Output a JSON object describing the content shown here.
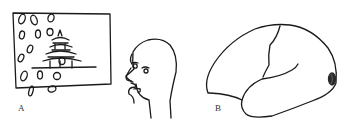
{
  "figure": {
    "panels": [
      {
        "label": "A",
        "description": "Sketch of a person in profile viewing a framed picture of a pagoda with falling petals"
      },
      {
        "label": "B",
        "description": "Lateral view outline of a brain with shaded lesion at occipital pole"
      }
    ]
  },
  "colors": {
    "stroke": "#1a1a1a",
    "background": "#ffffff",
    "lesion": "#2a2a2a"
  }
}
